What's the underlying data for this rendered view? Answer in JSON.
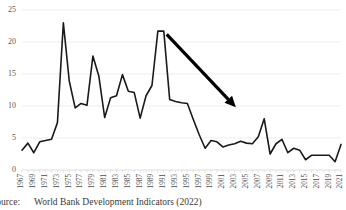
{
  "chart_data": {
    "type": "line",
    "title": "",
    "subtitle": "",
    "xlabel": "",
    "ylabel": "",
    "ylim": [
      0,
      25
    ],
    "ytick_values": [
      0,
      5,
      10,
      15,
      20,
      25
    ],
    "ytick_labels": [
      "0",
      "5",
      "10",
      "15",
      "20",
      "25"
    ],
    "grid": "horizontal",
    "legend": "none",
    "xlim": [
      1967,
      2021
    ],
    "xtick_labels": [
      "1967",
      "1969",
      "1971",
      "1973",
      "1975",
      "1977",
      "1979",
      "1981",
      "1983",
      "1985",
      "1987",
      "1989",
      "1991",
      "1993",
      "1995",
      "1997",
      "1999",
      "2001",
      "2003",
      "2005",
      "2007",
      "2009",
      "2011",
      "2013",
      "2015",
      "2017",
      "2019",
      "2021"
    ],
    "x": [
      1967,
      1968,
      1969,
      1970,
      1971,
      1972,
      1973,
      1974,
      1975,
      1976,
      1977,
      1978,
      1979,
      1980,
      1981,
      1982,
      1983,
      1984,
      1985,
      1986,
      1987,
      1988,
      1989,
      1990,
      1991,
      1992,
      1993,
      1994,
      1995,
      1996,
      1997,
      1998,
      1999,
      2000,
      2001,
      2002,
      2003,
      2004,
      2005,
      2006,
      2007,
      2008,
      2009,
      2010,
      2011,
      2012,
      2013,
      2014,
      2015,
      2016,
      2017,
      2018,
      2019,
      2020,
      2021
    ],
    "series": [
      {
        "name": "value",
        "color": "#1a1a1a",
        "values": [
          3.1,
          4.2,
          2.7,
          4.4,
          4.6,
          4.8,
          7.4,
          23.0,
          13.9,
          9.7,
          10.4,
          10.1,
          17.8,
          14.7,
          8.2,
          11.3,
          11.6,
          14.9,
          12.3,
          12.1,
          8.1,
          11.6,
          13.2,
          21.7,
          21.7,
          11.0,
          10.7,
          10.5,
          10.4,
          7.9,
          5.5,
          3.4,
          4.6,
          4.4,
          3.6,
          3.9,
          4.1,
          4.5,
          4.2,
          4.1,
          5.2,
          8.0,
          2.5,
          4.1,
          4.8,
          2.7,
          3.4,
          3.1,
          1.6,
          2.3,
          2.3,
          2.3,
          2.3,
          1.3,
          4.0
        ]
      }
    ],
    "annotations": [
      {
        "type": "arrow",
        "name": "downward-trend-arrow",
        "from": {
          "x": 1991.5,
          "y": 21.2
        },
        "to": {
          "x": 2003.2,
          "y": 9.8
        },
        "color": "#000000"
      }
    ],
    "axis_color": "#d9d9d9",
    "gridline_color": "#e6e6e6",
    "line_color": "#1a1a1a",
    "line_width": 1.6
  },
  "caption": {
    "source_label": "Source:",
    "source_text": "World Bank Development Indicators (2022)"
  }
}
